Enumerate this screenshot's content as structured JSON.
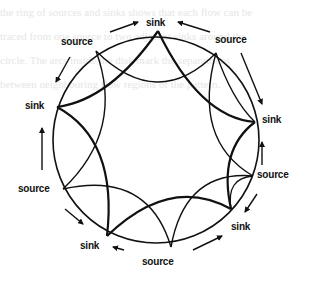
{
  "background_text": [
    "the ring of sources and sinks shows that each flow can be",
    "traced from one source to two adjacent sinks around the",
    "circle. The arcs inside the disk mark the separatrices",
    "between neighbouring flow regions of the pattern."
  ],
  "diagram": {
    "type": "flow-circle",
    "circle": {
      "cx": 157,
      "cy": 140,
      "r": 103
    },
    "stroke_color": "#111111",
    "nodes": [
      {
        "id": "n0",
        "label": "sink",
        "x": 158,
        "y": 31,
        "label_x": 146,
        "label_y": 17
      },
      {
        "id": "n1",
        "label": "source",
        "x": 216,
        "y": 53,
        "label_x": 215,
        "label_y": 36
      },
      {
        "id": "n2",
        "label": "sink",
        "x": 255,
        "y": 122,
        "label_x": 262,
        "label_y": 117
      },
      {
        "id": "n3",
        "label": "source",
        "x": 253,
        "y": 176,
        "label_x": 258,
        "label_y": 171
      },
      {
        "id": "n4",
        "label": "sink",
        "x": 231,
        "y": 209,
        "label_x": 231,
        "label_y": 222
      },
      {
        "id": "n5",
        "label": "source",
        "x": 171,
        "y": 247,
        "label_x": 142,
        "label_y": 257
      },
      {
        "id": "n6",
        "label": "sink",
        "x": 107,
        "y": 236,
        "label_x": 80,
        "label_y": 241
      },
      {
        "id": "n7",
        "label": "source",
        "x": 63,
        "y": 189,
        "label_x": 18,
        "label_y": 185
      },
      {
        "id": "n8",
        "label": "sink",
        "x": 57,
        "y": 107,
        "label_x": 25,
        "label_y": 101
      },
      {
        "id": "n9",
        "label": "source",
        "x": 96,
        "y": 51,
        "label_x": 61,
        "label_y": 37
      }
    ]
  }
}
